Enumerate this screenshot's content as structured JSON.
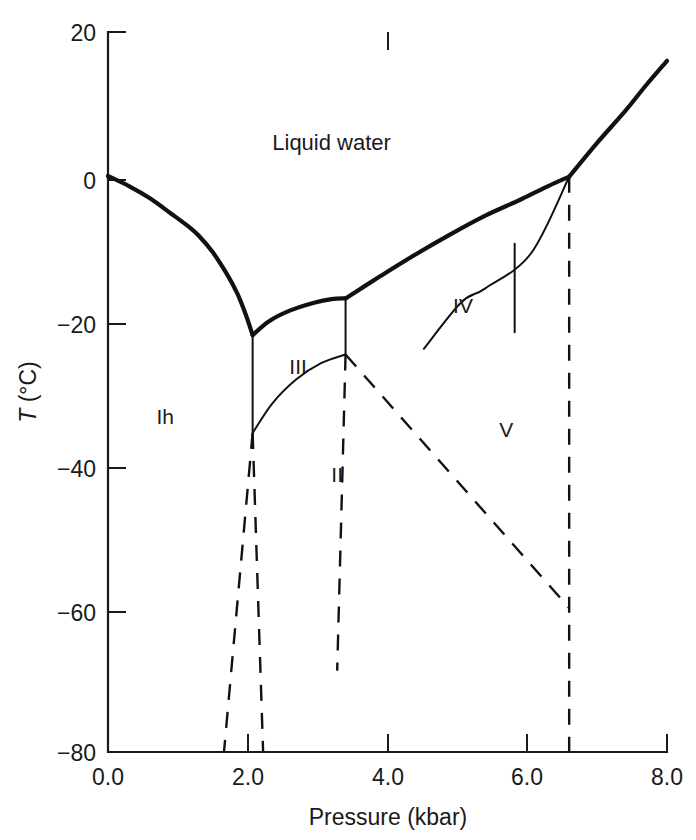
{
  "chart_data": {
    "type": "line",
    "title": "",
    "xlabel": "Pressure (kbar)",
    "ylabel": "T (°C)",
    "xlim": [
      0.0,
      8.0
    ],
    "ylim": [
      -80,
      20
    ],
    "grid": false,
    "legend": "none",
    "xticks": [
      "0.0",
      "2.0",
      "4.0",
      "6.0",
      "8.0"
    ],
    "xtick_values": [
      0.0,
      2.0,
      4.0,
      6.0,
      8.0
    ],
    "yticks": [
      "20",
      "0",
      "-20",
      "-40",
      "-60",
      "-80"
    ],
    "ytick_values": [
      20,
      0,
      -20,
      -40,
      -60,
      -80
    ],
    "annotations": [
      {
        "text": "Liquid water",
        "x": 3.2,
        "y": 3.6
      },
      {
        "text": "Ih",
        "x": 0.82,
        "y": -34.5
      },
      {
        "text": "III",
        "x": 2.72,
        "y": -27.5
      },
      {
        "text": "II",
        "x": 3.28,
        "y": -42.5
      },
      {
        "text": "IV",
        "x": 5.08,
        "y": -19.0
      },
      {
        "text": "V",
        "x": 5.7,
        "y": -36.2
      }
    ],
    "series": [
      {
        "name": "Ih-liquid melting curve",
        "style": "solid-thick",
        "points": [
          [
            0.0,
            0.0
          ],
          [
            0.3,
            -1.4
          ],
          [
            0.6,
            -3.1
          ],
          [
            0.9,
            -5.2
          ],
          [
            1.15,
            -7.0
          ],
          [
            1.3,
            -8.3
          ],
          [
            1.5,
            -10.6
          ],
          [
            1.7,
            -13.6
          ],
          [
            1.85,
            -16.3
          ],
          [
            1.97,
            -19.2
          ],
          [
            2.07,
            -22.1
          ]
        ]
      },
      {
        "name": "III-liquid melting curve",
        "style": "solid-thick",
        "points": [
          [
            2.07,
            -22.1
          ],
          [
            2.3,
            -20.2
          ],
          [
            2.6,
            -18.7
          ],
          [
            2.95,
            -17.6
          ],
          [
            3.2,
            -17.1
          ],
          [
            3.4,
            -17.0
          ]
        ]
      },
      {
        "name": "V-liquid melting curve",
        "style": "solid-thick",
        "points": [
          [
            3.4,
            -17.0
          ],
          [
            3.9,
            -13.9
          ],
          [
            4.4,
            -10.9
          ],
          [
            4.9,
            -8.1
          ],
          [
            5.4,
            -5.5
          ],
          [
            5.9,
            -3.3
          ],
          [
            6.3,
            -1.4
          ],
          [
            6.6,
            -0.1
          ]
        ]
      },
      {
        "name": "VI-liquid melting curve",
        "style": "solid-thick",
        "points": [
          [
            6.6,
            -0.1
          ],
          [
            7.0,
            4.6
          ],
          [
            7.4,
            9.0
          ],
          [
            7.7,
            12.6
          ],
          [
            8.0,
            16.0
          ]
        ]
      },
      {
        "name": "Ih-III boundary",
        "style": "solid-thin",
        "points": [
          [
            2.07,
            -22.1
          ],
          [
            2.07,
            -35.7
          ]
        ]
      },
      {
        "name": "Ih-II boundary",
        "style": "solid-thin",
        "points": [
          [
            2.07,
            -35.7
          ],
          [
            2.35,
            -31.6
          ],
          [
            2.7,
            -28.2
          ],
          [
            3.05,
            -26.0
          ],
          [
            3.4,
            -24.8
          ]
        ]
      },
      {
        "name": "II-III boundary",
        "style": "solid-thin",
        "points": [
          [
            3.4,
            -17.0
          ],
          [
            3.4,
            -24.8
          ]
        ]
      },
      {
        "name": "IV metastable boundary",
        "style": "solid-thin",
        "points": [
          [
            4.52,
            -24.0
          ],
          [
            5.05,
            -17.6
          ],
          [
            5.4,
            -15.6
          ],
          [
            6.05,
            -10.8
          ],
          [
            6.6,
            -0.1
          ]
        ]
      },
      {
        "name": "IV metastable tick",
        "style": "solid-thin",
        "points": [
          [
            5.82,
            -9.4
          ],
          [
            5.82,
            -21.7
          ]
        ]
      },
      {
        "name": "Ih-II extrapolation (left dashed)",
        "style": "dashed",
        "points": [
          [
            2.07,
            -35.7
          ],
          [
            1.66,
            -80.0
          ]
        ]
      },
      {
        "name": "Ih-II extrapolation (right dashed)",
        "style": "dashed",
        "points": [
          [
            2.07,
            -35.7
          ],
          [
            2.22,
            -80.0
          ]
        ]
      },
      {
        "name": "II-III extrapolation (dashed)",
        "style": "dashed",
        "points": [
          [
            3.4,
            -24.8
          ],
          [
            3.28,
            -68.7
          ]
        ]
      },
      {
        "name": "II-V extrapolation (dashed)",
        "style": "dashed",
        "points": [
          [
            3.4,
            -24.8
          ],
          [
            6.6,
            -60.0
          ]
        ]
      },
      {
        "name": "V-VI boundary (dashed)",
        "style": "dashed",
        "points": [
          [
            6.6,
            -0.1
          ],
          [
            6.6,
            -80.0
          ]
        ]
      }
    ]
  },
  "axes": {
    "x_title": "Pressure (kbar)",
    "y_title_variable": "T",
    "y_title_unit": "(°C)"
  },
  "labels": {
    "liquid_water": "Liquid water",
    "ice_ih": "Ih",
    "ice_ii": "II",
    "ice_iii": "III",
    "ice_iv": "IV",
    "ice_v": "V"
  },
  "xtick_labels": [
    "0.0",
    "2.0",
    "4.0",
    "6.0",
    "8.0"
  ],
  "ytick_labels": [
    "20",
    "0",
    "−20",
    "−40",
    "−60",
    "−80"
  ],
  "colors": {
    "ink": "#111111",
    "background": "#ffffff"
  }
}
